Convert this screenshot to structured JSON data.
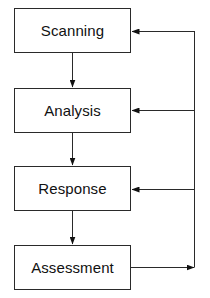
{
  "diagram": {
    "type": "flowchart-cycle",
    "nodes": [
      {
        "id": "scanning",
        "label": "Scanning"
      },
      {
        "id": "analysis",
        "label": "Analysis"
      },
      {
        "id": "response",
        "label": "Response"
      },
      {
        "id": "assessment",
        "label": "Assessment"
      }
    ],
    "edges": [
      {
        "from": "scanning",
        "to": "analysis"
      },
      {
        "from": "analysis",
        "to": "response"
      },
      {
        "from": "response",
        "to": "assessment"
      },
      {
        "from": "assessment",
        "to": "feedback-line"
      },
      {
        "from": "feedback-line",
        "to": "scanning"
      },
      {
        "from": "feedback-line",
        "to": "analysis"
      },
      {
        "from": "feedback-line",
        "to": "response"
      }
    ],
    "colors": {
      "stroke": "#2a2a2a",
      "text": "#111111",
      "background": "#ffffff"
    }
  }
}
